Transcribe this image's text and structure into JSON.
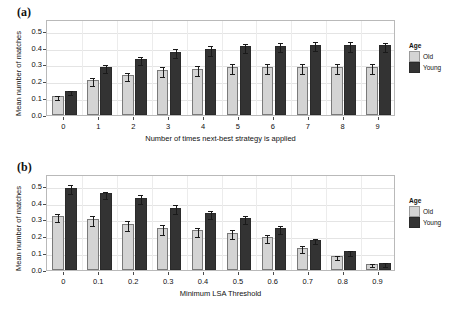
{
  "figure": {
    "panels": [
      {
        "label": "(a)",
        "ylabel": "Mean number of matches",
        "xlabel": "Number of times next-best strategy is applied",
        "legend_title": "Age"
      },
      {
        "label": "(b)",
        "ylabel": "Mean number of matches",
        "xlabel": "Minimum LSA Threshold",
        "legend_title": "Age"
      }
    ]
  },
  "colors": {
    "old": "#d4d4d4",
    "young": "#333333",
    "frame": "#b9b9b9",
    "grid": "#e4e4e4",
    "text": "#111111"
  },
  "chart_data": [
    {
      "type": "bar",
      "panel": "(a)",
      "title": "",
      "xlabel": "Number of times next-best strategy is applied",
      "ylabel": "Mean number of matches",
      "categories": [
        "0",
        "1",
        "2",
        "3",
        "4",
        "5",
        "6",
        "7",
        "8",
        "9"
      ],
      "ylim": [
        0.0,
        0.57
      ],
      "yticks": [
        "0.0",
        "0.1",
        "0.2",
        "0.3",
        "0.4",
        "0.5"
      ],
      "ytick_values": [
        0.0,
        0.1,
        0.2,
        0.3,
        0.4,
        0.5
      ],
      "grid": true,
      "legend_position": "right",
      "legend_title": "Age",
      "series": [
        {
          "name": "Old",
          "color": "#d4d4d4",
          "values": [
            0.112,
            0.208,
            0.24,
            0.267,
            0.274,
            0.283,
            0.283,
            0.284,
            0.285,
            0.285
          ],
          "errors": [
            0.014,
            0.022,
            0.024,
            0.027,
            0.03,
            0.03,
            0.03,
            0.03,
            0.03,
            0.03
          ]
        },
        {
          "name": "Young",
          "color": "#333333",
          "values": [
            0.143,
            0.285,
            0.333,
            0.376,
            0.392,
            0.408,
            0.412,
            0.417,
            0.417,
            0.413
          ],
          "errors": [
            0.014,
            0.026,
            0.026,
            0.025,
            0.029,
            0.028,
            0.028,
            0.028,
            0.029,
            0.029
          ]
        }
      ]
    },
    {
      "type": "bar",
      "panel": "(b)",
      "title": "",
      "xlabel": "Minimum LSA Threshold",
      "ylabel": "Mean number of matches",
      "categories": [
        "0",
        "0.1",
        "0.2",
        "0.3",
        "0.4",
        "0.5",
        "0.6",
        "0.7",
        "0.8",
        "0.9"
      ],
      "ylim": [
        0.0,
        0.57
      ],
      "yticks": [
        "0.0",
        "0.1",
        "0.2",
        "0.3",
        "0.4",
        "0.5"
      ],
      "ytick_values": [
        0.0,
        0.1,
        0.2,
        0.3,
        0.4,
        0.5
      ],
      "grid": true,
      "legend_position": "right",
      "legend_title": "Age",
      "series": [
        {
          "name": "Old",
          "color": "#d4d4d4",
          "values": [
            0.321,
            0.303,
            0.274,
            0.249,
            0.236,
            0.222,
            0.195,
            0.133,
            0.084,
            0.037
          ],
          "errors": [
            0.026,
            0.031,
            0.029,
            0.031,
            0.028,
            0.025,
            0.023,
            0.02,
            0.013,
            0.009
          ]
        },
        {
          "name": "Young",
          "color": "#333333",
          "values": [
            0.488,
            0.456,
            0.43,
            0.37,
            0.336,
            0.307,
            0.25,
            0.18,
            0.11,
            0.042
          ],
          "errors": [
            0.027,
            0.021,
            0.026,
            0.028,
            0.024,
            0.023,
            0.024,
            0.016,
            0.013,
            0.01
          ]
        }
      ]
    }
  ],
  "legend": {
    "title": "Age",
    "items": [
      {
        "label": "Old",
        "color": "#d4d4d4"
      },
      {
        "label": "Young",
        "color": "#333333"
      }
    ]
  }
}
